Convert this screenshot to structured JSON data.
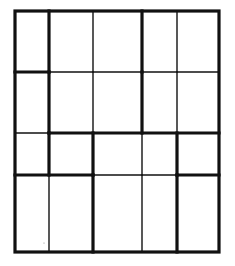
{
  "diagram": {
    "width": 235,
    "height": 266,
    "background": "#ffffff",
    "line_color": "#111111",
    "thick": 3.2,
    "thin": 1.4,
    "outline": {
      "x": 15,
      "y": 11,
      "w": 204,
      "h": 241
    },
    "columns_x": [
      15,
      49,
      93,
      142,
      177,
      219
    ],
    "rows_y": [
      11,
      72,
      133,
      175,
      252
    ],
    "vertical_segments": [
      {
        "x": 49,
        "y1": 11,
        "y2": 72,
        "w": "thick"
      },
      {
        "x": 49,
        "y1": 72,
        "y2": 133,
        "w": "thick"
      },
      {
        "x": 49,
        "y1": 133,
        "y2": 175,
        "w": "thick"
      },
      {
        "x": 49,
        "y1": 175,
        "y2": 252,
        "w": "thin"
      },
      {
        "x": 93,
        "y1": 11,
        "y2": 72,
        "w": "thin"
      },
      {
        "x": 93,
        "y1": 72,
        "y2": 133,
        "w": "thin"
      },
      {
        "x": 93,
        "y1": 133,
        "y2": 175,
        "w": "thick"
      },
      {
        "x": 93,
        "y1": 175,
        "y2": 252,
        "w": "thick"
      },
      {
        "x": 142,
        "y1": 11,
        "y2": 72,
        "w": "thick"
      },
      {
        "x": 142,
        "y1": 72,
        "y2": 133,
        "w": "thick"
      },
      {
        "x": 142,
        "y1": 133,
        "y2": 175,
        "w": "thin"
      },
      {
        "x": 142,
        "y1": 175,
        "y2": 252,
        "w": "thin"
      },
      {
        "x": 177,
        "y1": 11,
        "y2": 72,
        "w": "thin"
      },
      {
        "x": 177,
        "y1": 72,
        "y2": 133,
        "w": "thin"
      },
      {
        "x": 177,
        "y1": 133,
        "y2": 175,
        "w": "thick"
      },
      {
        "x": 177,
        "y1": 175,
        "y2": 252,
        "w": "thick"
      }
    ],
    "horizontal_segments": [
      {
        "y": 72,
        "x1": 15,
        "x2": 49,
        "w": "thick"
      },
      {
        "y": 72,
        "x1": 49,
        "x2": 219,
        "w": "thin"
      },
      {
        "y": 133,
        "x1": 15,
        "x2": 49,
        "w": "thin"
      },
      {
        "y": 133,
        "x1": 49,
        "x2": 219,
        "w": "thick"
      },
      {
        "y": 175,
        "x1": 15,
        "x2": 93,
        "w": "thick"
      },
      {
        "y": 175,
        "x1": 93,
        "x2": 177,
        "w": "thin"
      },
      {
        "y": 175,
        "x1": 177,
        "x2": 219,
        "w": "thick"
      }
    ],
    "stray_dot": {
      "x": 44,
      "y": 243,
      "r": 0.6
    }
  }
}
